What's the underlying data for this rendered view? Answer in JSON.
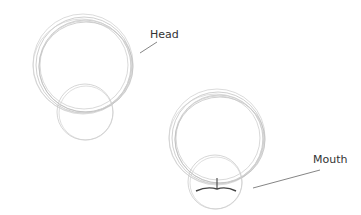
{
  "figures": [
    {
      "label": "Head"
    },
    {
      "label": "Mouth"
    }
  ],
  "colors": {
    "sketch": "#bbbbbb",
    "sketch_dark": "#999999",
    "leader": "#666666",
    "mouth": "#444444"
  }
}
